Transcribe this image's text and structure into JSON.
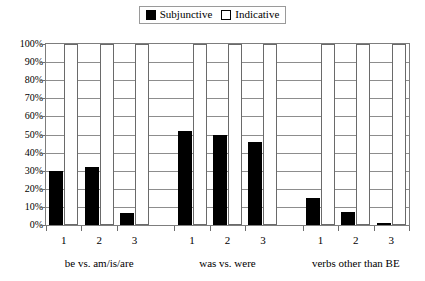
{
  "legend": {
    "items": [
      {
        "label": "Subjunctive",
        "swatch": "filled-square-icon",
        "color": "#000000"
      },
      {
        "label": "Indicative",
        "swatch": "hollow-square-icon",
        "color": "#ffffff"
      }
    ]
  },
  "chart_data": {
    "type": "bar",
    "title": "",
    "subtitle": "",
    "xlabel": "",
    "ylabel": "",
    "ylim": [
      0,
      100
    ],
    "ytick_labels": [
      "0%",
      "10%",
      "20%",
      "30%",
      "40%",
      "50%",
      "60%",
      "70%",
      "80%",
      "90%",
      "100%"
    ],
    "ytick_values": [
      0,
      10,
      20,
      30,
      40,
      50,
      60,
      70,
      80,
      90,
      100
    ],
    "grid": true,
    "legend_position": "top-center",
    "groups": [
      {
        "name": "be vs. am/is/are",
        "categories": [
          "1",
          "2",
          "3"
        ]
      },
      {
        "name": "was vs. were",
        "categories": [
          "1",
          "2",
          "3"
        ]
      },
      {
        "name": "verbs other than BE",
        "categories": [
          "1",
          "2",
          "3"
        ]
      }
    ],
    "categories": [
      "1",
      "2",
      "3",
      "1",
      "2",
      "3",
      "1",
      "2",
      "3"
    ],
    "series": [
      {
        "name": "Subjunctive",
        "color": "#000000",
        "values": [
          30,
          32,
          6.5,
          52,
          50,
          46,
          15,
          7,
          1
        ]
      },
      {
        "name": "Indicative",
        "color": "#ffffff",
        "values": [
          100,
          100,
          100,
          100,
          100,
          100,
          100,
          100,
          100
        ]
      }
    ]
  }
}
